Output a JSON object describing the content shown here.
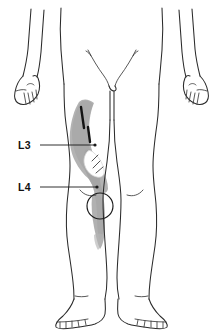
{
  "figure": {
    "view": "anterior",
    "background_color": "#ffffff",
    "outline_color": "#2b2b2b",
    "shade_color": "#a8a8a8",
    "marker_color": "#141414"
  },
  "labels": [
    {
      "id": "l3",
      "text": "L3",
      "description": "Third lumbar nerve root dermatome, anterior mid-thigh",
      "leader_from_x": 40,
      "leader_to_x": 95,
      "leader_y": 145
    },
    {
      "id": "l4",
      "text": "L4",
      "description": "Fourth lumbar nerve root dermatome, medial knee and shin",
      "leader_from_x": 40,
      "leader_to_x": 97,
      "leader_y": 187
    }
  ],
  "annotations": {
    "patella_marker": "circle-at-left-knee",
    "dark_markers": "two-short-dark-strokes-upper-thigh",
    "shaded_band": "diagonal-gray-band-from-hip-to-medial-shin"
  }
}
